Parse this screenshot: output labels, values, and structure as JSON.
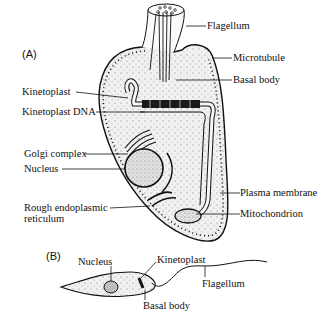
{
  "panels": {
    "a": {
      "label": "(A)",
      "labels": {
        "flagellum": "Flagellum",
        "microtubule": "Microtubule",
        "basal_body": "Basal body",
        "kinetoplast": "Kinetoplast",
        "kinetoplast_dna": "Kinetoplast DNA",
        "golgi": "Golgi complex",
        "nucleus": "Nucleus",
        "rer_line1": "Rough endoplasmic",
        "rer_line2": "reticulum",
        "plasma_membrane": "Plasma membrane",
        "mitochondrion": "Mitochondrion"
      }
    },
    "b": {
      "label": "(B)",
      "labels": {
        "nucleus": "Nucleus",
        "kinetoplast": "Kinetoplast",
        "basal_body": "Basal body",
        "flagellum": "Flagellum"
      }
    }
  }
}
